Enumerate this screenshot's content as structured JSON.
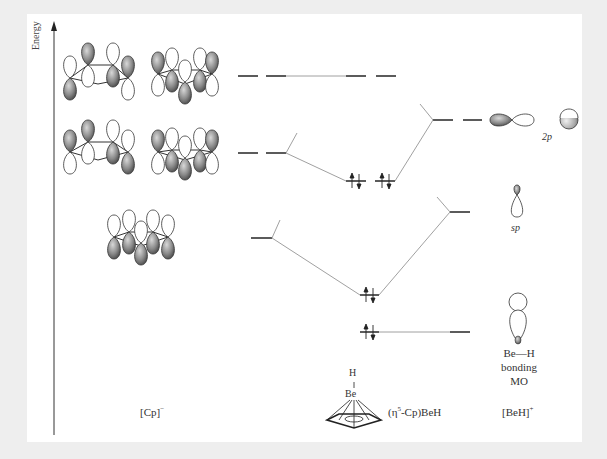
{
  "axis": {
    "label": "Energy"
  },
  "columns": {
    "left": {
      "label": "[Cp]",
      "superscript": "−"
    },
    "middle": {
      "label_prefix": "(η",
      "label_sup": "5",
      "label_suffix": "-Cp)BeH"
    },
    "right": {
      "label": "[BeH]",
      "superscript": "+"
    }
  },
  "right_orbitals": {
    "p_label": "2p",
    "sp_label": "sp",
    "bonding_line1": "Be—H",
    "bonding_line2": "bonding",
    "bonding_line3": "MO"
  },
  "molecule": {
    "atom_top": "H",
    "atom_bond": "|",
    "atom_metal": "Be"
  },
  "levels": {
    "cp": [
      {
        "name": "cp-e2",
        "y": 76,
        "degenerate": 2
      },
      {
        "name": "cp-e1",
        "y": 153,
        "degenerate": 2
      },
      {
        "name": "cp-a1",
        "y": 238,
        "degenerate": 1
      }
    ],
    "complex": [
      {
        "name": "complex-e2",
        "y": 76,
        "electrons": 0
      },
      {
        "name": "complex-e1",
        "y": 181,
        "electrons": 4
      },
      {
        "name": "complex-a1",
        "y": 295,
        "electrons": 2
      },
      {
        "name": "complex-bh",
        "y": 332,
        "electrons": 2
      }
    ],
    "beh": [
      {
        "name": "beh-2p",
        "y": 120,
        "degenerate": 2
      },
      {
        "name": "beh-sp",
        "y": 212,
        "degenerate": 1
      },
      {
        "name": "beh-bonding",
        "y": 332,
        "degenerate": 1
      }
    ]
  },
  "colors": {
    "line": "#444444",
    "connector": "#888888",
    "lobe_fill": "#7a7a7a",
    "background": "#eeeeee",
    "panel": "#ffffff"
  }
}
